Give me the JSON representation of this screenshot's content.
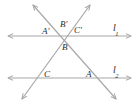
{
  "figure": {
    "background": "#ffffff",
    "line_color": "#a8a8a8",
    "label_color": "#2b2b2b",
    "stroke_width": 1.2,
    "width": 137,
    "height": 106
  },
  "lines": {
    "l1": {
      "label": "l",
      "subscript": "1",
      "y": 36,
      "x_start": 8,
      "x_end": 131,
      "arrows": "both"
    },
    "l2": {
      "label": "l",
      "subscript": "2",
      "y": 78,
      "x_start": 8,
      "x_end": 131,
      "arrows": "both"
    },
    "transversal_left": {
      "from_x": 33,
      "from_y": 5,
      "to_x": 116,
      "to_y": 99,
      "arrows": "both"
    },
    "transversal_right": {
      "from_x": 90,
      "from_y": 5,
      "to_x": 22,
      "to_y": 99,
      "arrows": "both"
    }
  },
  "labels": {
    "a_prime": {
      "text": "A'",
      "x": 42,
      "y": 27
    },
    "b_prime": {
      "text": "B'",
      "x": 60,
      "y": 20
    },
    "c_prime": {
      "text": "C'",
      "x": 74,
      "y": 26
    },
    "b": {
      "text": "B",
      "x": 62,
      "y": 43
    },
    "c": {
      "text": "C",
      "x": 44,
      "y": 70
    },
    "a": {
      "text": "A",
      "x": 86,
      "y": 70
    },
    "l1": {
      "x": 113,
      "y": 23
    },
    "l2": {
      "x": 113,
      "y": 65
    }
  }
}
